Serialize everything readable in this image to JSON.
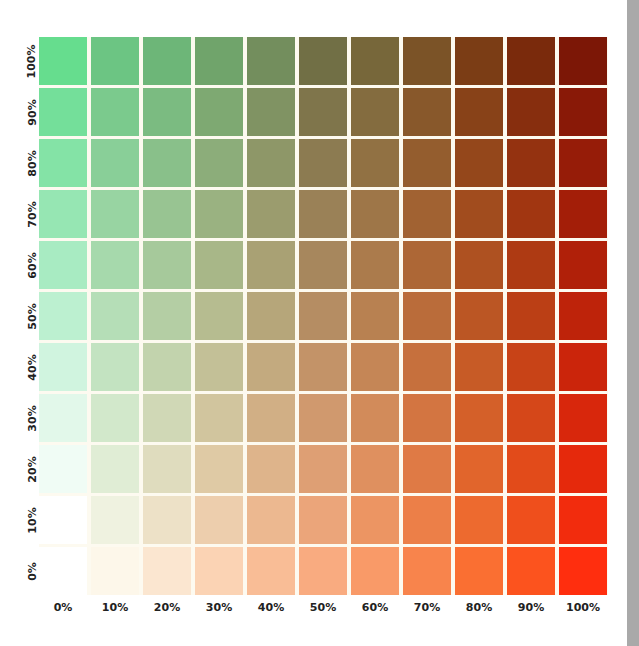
{
  "chart_data": {
    "type": "heatmap",
    "title": "",
    "xlabel": "",
    "ylabel": "",
    "x_ticks": [
      "0%",
      "10%",
      "20%",
      "30%",
      "40%",
      "50%",
      "60%",
      "70%",
      "80%",
      "90%",
      "100%"
    ],
    "y_ticks_bottom_to_top": [
      "0%",
      "10%",
      "20%",
      "30%",
      "40%",
      "50%",
      "60%",
      "70%",
      "80%",
      "90%",
      "100%"
    ],
    "rows_top_to_bottom": [
      {
        "label": "100%",
        "colors": [
          "#66dd8e",
          "#6cc583",
          "#6db678",
          "#70a46b",
          "#738e5d",
          "#716f45",
          "#77673a",
          "#7b5327",
          "#7b3d15",
          "#7a2a0c",
          "#7c1706"
        ]
      },
      {
        "label": "90%",
        "colors": [
          "#74df9a",
          "#7bca8d",
          "#7bbb81",
          "#7ea972",
          "#809363",
          "#7f754b",
          "#846c3f",
          "#88582b",
          "#884218",
          "#872e0e",
          "#891907"
        ]
      },
      {
        "label": "80%",
        "colors": [
          "#84e3a6",
          "#89cf98",
          "#89c08a",
          "#8cad7a",
          "#8e9768",
          "#8c7b51",
          "#917143",
          "#945d2e",
          "#94471b",
          "#943210",
          "#961c08"
        ]
      },
      {
        "label": "70%",
        "colors": [
          "#96e6b3",
          "#98d4a2",
          "#98c492",
          "#9ab281",
          "#9b9c6e",
          "#9a8157",
          "#9e7648",
          "#a16232",
          "#a14c1e",
          "#a13611",
          "#a31e08"
        ]
      },
      {
        "label": "60%",
        "colors": [
          "#a8ebc2",
          "#a6d9ac",
          "#a6c99b",
          "#a8b788",
          "#a9a174",
          "#a7875d",
          "#ab7b4c",
          "#ad6736",
          "#ae5121",
          "#ae3a13",
          "#b02009"
        ]
      },
      {
        "label": "50%",
        "colors": [
          "#bcf0d0",
          "#b5deb7",
          "#b4cea4",
          "#b6bc90",
          "#b6a67a",
          "#b58d63",
          "#b88151",
          "#ba6c3a",
          "#bb5624",
          "#bb3f15",
          "#be230a"
        ]
      },
      {
        "label": "40%",
        "colors": [
          "#d0f4df",
          "#c3e3c1",
          "#c2d3ad",
          "#c3c097",
          "#c3aa7f",
          "#c39368",
          "#c58656",
          "#c6703d",
          "#c75b26",
          "#c84317",
          "#cb250b"
        ]
      },
      {
        "label": "30%",
        "colors": [
          "#e2f8ea",
          "#d2e8cb",
          "#d0d8b6",
          "#d1c59e",
          "#d1af85",
          "#d0996e",
          "#d28b5a",
          "#d37541",
          "#d46029",
          "#d54719",
          "#d8270c"
        ]
      },
      {
        "label": "20%",
        "colors": [
          "#f0fcf5",
          "#e0edd5",
          "#dfdcbe",
          "#dfcaa5",
          "#deb48b",
          "#de9f74",
          "#df905f",
          "#df7a45",
          "#e1652c",
          "#e24b1a",
          "#e5290c"
        ]
      },
      {
        "label": "10%",
        "colors": [
          "#ffffff",
          "#eff2e0",
          "#ede1c7",
          "#edcead",
          "#ecb890",
          "#eba57a",
          "#ec9563",
          "#ec7f48",
          "#ed6a2f",
          "#ef4f1c",
          "#f22c0d"
        ]
      },
      {
        "label": "0%",
        "colors": [
          "#ffffff",
          "#fdf7ea",
          "#fbe6d0",
          "#fbd3b4",
          "#f9bd96",
          "#f9ab80",
          "#f99a68",
          "#f8844c",
          "#fa6f32",
          "#fc531e",
          "#ff2e0e"
        ]
      }
    ],
    "legend": "none",
    "grid": true
  },
  "ui": {
    "scrollbar_color": "#a9a9a9",
    "grid_line_color": "#fdfaf0"
  }
}
